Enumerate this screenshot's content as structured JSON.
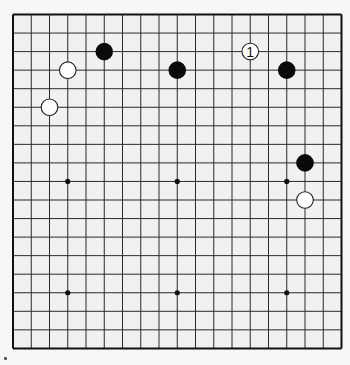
{
  "board": {
    "size": 19,
    "origin_x": 13,
    "origin_y": 14.5,
    "spacing_x": 18.25,
    "spacing_y": 18.55,
    "line_color": "#2a2a2a",
    "border_color": "#111111",
    "background": "#f1f1f1",
    "star_points": [
      [
        3,
        3
      ],
      [
        9,
        3
      ],
      [
        15,
        3
      ],
      [
        3,
        9
      ],
      [
        9,
        9
      ],
      [
        15,
        9
      ],
      [
        3,
        15
      ],
      [
        9,
        15
      ],
      [
        15,
        15
      ]
    ]
  },
  "stones": [
    {
      "color": "black",
      "col": 5,
      "row": 2,
      "label": ""
    },
    {
      "color": "black",
      "col": 9,
      "row": 3,
      "label": ""
    },
    {
      "color": "white",
      "col": 13,
      "row": 2,
      "label": "1"
    },
    {
      "color": "black",
      "col": 15,
      "row": 3,
      "label": ""
    },
    {
      "color": "white",
      "col": 3,
      "row": 3,
      "label": ""
    },
    {
      "color": "white",
      "col": 2,
      "row": 5,
      "label": ""
    },
    {
      "color": "black",
      "col": 16,
      "row": 8,
      "label": ""
    },
    {
      "color": "white",
      "col": 16,
      "row": 10,
      "label": ""
    }
  ],
  "colors": {
    "black_stone": "#0a0a0a",
    "white_stone": "#ffffff",
    "white_stone_edge": "#222222"
  }
}
